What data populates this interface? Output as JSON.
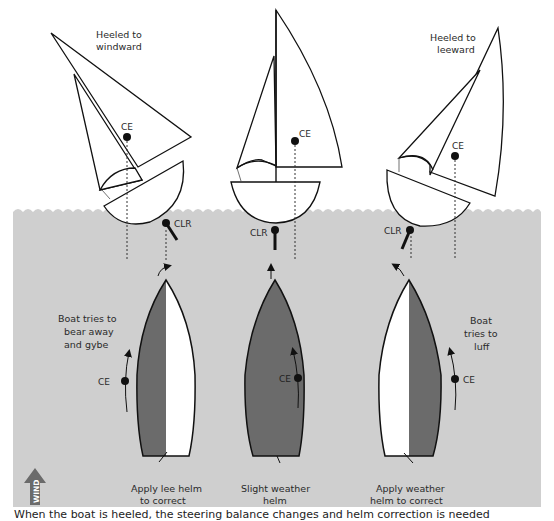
{
  "colors": {
    "water": "#cfcfcf",
    "hull_dark": "#6b6b6b",
    "hull_light": "#ffffff",
    "line": "#111111"
  },
  "panels": [
    {
      "id": "windward",
      "heading": [
        "Heeled to",
        "windward"
      ],
      "ce_label": "CE",
      "clr_label": "CLR",
      "effect": [
        "Boat tries to",
        "bear away",
        "and gybe"
      ],
      "correction": [
        "Apply lee helm",
        "to correct"
      ]
    },
    {
      "id": "upright",
      "heading": [],
      "ce_label": "CE",
      "clr_label": "CLR",
      "effect": [],
      "correction": [
        "Slight weather",
        "helm"
      ]
    },
    {
      "id": "leeward",
      "heading": [
        "Heeled to",
        "leeward"
      ],
      "ce_label": "CE",
      "clr_label": "CLR",
      "effect": [
        "Boat",
        "tries to",
        "luff"
      ],
      "correction": [
        "Apply weather",
        "helm to correct"
      ]
    }
  ],
  "wind_label": "WIND",
  "caption": "When the boat is heeled, the steering balance changes and helm correction is needed"
}
